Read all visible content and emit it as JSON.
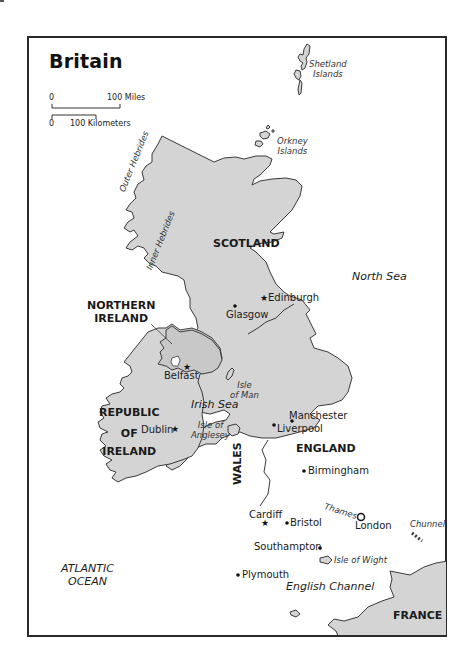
{
  "map": {
    "title": "Britain",
    "scale": {
      "miles_start": "0",
      "miles_end": "100 Miles",
      "km_start": "0",
      "km_end": "100 Kilometers"
    },
    "countries": {
      "scotland": "SCOTLAND",
      "northern_ireland_1": "NORTHERN",
      "northern_ireland_2": "IRELAND",
      "republic_1": "REPUBLIC",
      "republic_2": "OF",
      "republic_3": "IRELAND",
      "england": "ENGLAND",
      "wales": "WALES",
      "france": "FRANCE"
    },
    "water": {
      "north_sea": "North Sea",
      "irish_sea": "Irish Sea",
      "atlantic_1": "ATLANTIC",
      "atlantic_2": "OCEAN",
      "english_channel": "English Channel",
      "thames": "Thames",
      "chunnel": "Chunnel"
    },
    "islands": {
      "shetland_1": "Shetland",
      "shetland_2": "Islands",
      "orkney_1": "Orkney",
      "orkney_2": "Islands",
      "outer_hebrides": "Outer Hebrides",
      "inner_hebrides": "Inner Hebrides",
      "isle_of_man_1": "Isle",
      "isle_of_man_2": "of Man",
      "anglesey_1": "Isle of",
      "anglesey_2": "Anglesey",
      "wight": "Isle of Wight"
    },
    "cities": {
      "edinburgh": "Edinburgh",
      "glasgow": "Glasgow",
      "belfast": "Belfast",
      "dublin": "Dublin",
      "manchester": "Manchester",
      "liverpool": "Liverpool",
      "birmingham": "Birmingham",
      "cardiff": "Cardiff",
      "bristol": "Bristol",
      "london": "London",
      "southampton": "Southampton",
      "plymouth": "Plymouth"
    },
    "colors": {
      "land": "#d4d4d4",
      "outline": "#3a3a3a",
      "water": "#ffffff",
      "river": "#ffffff",
      "frame": "#2a2a2a"
    }
  }
}
